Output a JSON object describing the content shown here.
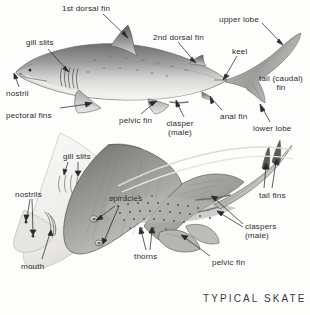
{
  "figure": {
    "background_color": "#fdfdfc",
    "ink_color": "#2b2b2b",
    "plate_title": "TYPICAL SKATE"
  },
  "shark": {
    "common_name_implied": "shark",
    "labels": [
      {
        "id": "first-dorsal-fin",
        "text": "1st dorsal fin",
        "x": 62,
        "y": 4,
        "align": "left",
        "leader_to": [
          128,
          38
        ]
      },
      {
        "id": "gill-slits-shark",
        "text": "gill slits",
        "x": 26,
        "y": 38,
        "align": "left",
        "leader_to": [
          68,
          72
        ]
      },
      {
        "id": "nostril",
        "text": "nostril",
        "x": 6,
        "y": 89,
        "align": "left",
        "leader_to": [
          18,
          73
        ]
      },
      {
        "id": "pectoral-fins",
        "text": "pectoral fins",
        "x": 6,
        "y": 111,
        "align": "left",
        "leader_to": [
          90,
          103
        ]
      },
      {
        "id": "pelvic-fin-shark",
        "text": "pelvic fin",
        "x": 119,
        "y": 116,
        "align": "left",
        "leader_to": [
          155,
          101
        ]
      },
      {
        "id": "second-dorsal-fin",
        "text": "2nd dorsal fin",
        "x": 153,
        "y": 33,
        "align": "left",
        "leader_to": [
          196,
          63
        ]
      },
      {
        "id": "clasper-male",
        "text": "clasper\n(male)",
        "x": 180,
        "y": 119,
        "align": "center",
        "leader_to": [
          178,
          101
        ]
      },
      {
        "id": "keel",
        "text": "keel",
        "x": 232,
        "y": 47,
        "align": "left",
        "leader_to": [
          224,
          78
        ]
      },
      {
        "id": "anal-fin",
        "text": "anal fin",
        "x": 220,
        "y": 112,
        "align": "left",
        "leader_to": [
          212,
          97
        ]
      },
      {
        "id": "upper-lobe",
        "text": "upper lobe",
        "x": 219,
        "y": 15,
        "align": "left",
        "leader_to": [
          282,
          45
        ]
      },
      {
        "id": "tail-caudal-fin",
        "text": "tail (caudal)\nfin",
        "x": 258,
        "y": 74,
        "align": "center",
        "leader_to": null
      },
      {
        "id": "lower-lobe",
        "text": "lower lobe",
        "x": 256,
        "y": 124,
        "align": "left",
        "leader_to": [
          262,
          106
        ]
      }
    ]
  },
  "skate": {
    "labels": [
      {
        "id": "gill-slits-skate",
        "text": "gill slits",
        "x": 63,
        "y": 152,
        "align": "left",
        "leader_to": [
          80,
          176
        ]
      },
      {
        "id": "nostrils",
        "text": "nostrils",
        "x": 17,
        "y": 190,
        "align": "left",
        "leader_to": [
          31,
          232
        ]
      },
      {
        "id": "mouth",
        "text": "mouth",
        "x": 21,
        "y": 262,
        "align": "left",
        "leader_to": [
          46,
          232
        ]
      },
      {
        "id": "spiracles",
        "text": "spiracles",
        "x": 109,
        "y": 194,
        "align": "left",
        "leader_to": [
          106,
          243
        ]
      },
      {
        "id": "thorns",
        "text": "thorns",
        "x": 134,
        "y": 252,
        "align": "left",
        "leader_to": [
          142,
          228
        ]
      },
      {
        "id": "pelvic-fin-skate",
        "text": "pelvic fin",
        "x": 212,
        "y": 258,
        "align": "left",
        "leader_to": [
          182,
          235
        ]
      },
      {
        "id": "claspers-male",
        "text": "claspers\n(male)",
        "x": 245,
        "y": 222,
        "align": "left",
        "leader_to": [
          212,
          197
        ]
      },
      {
        "id": "tail-fins",
        "text": "tail fins",
        "x": 259,
        "y": 191,
        "align": "left",
        "leader_to": [
          268,
          160
        ]
      }
    ]
  }
}
